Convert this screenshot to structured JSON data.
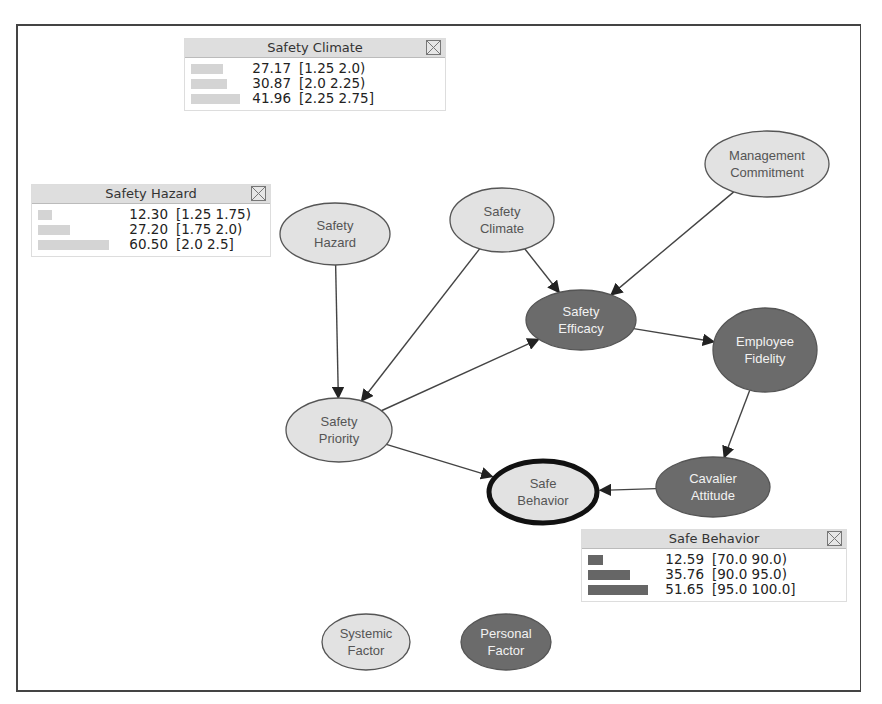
{
  "colors": {
    "light_node_fill": "#e2e2e2",
    "dark_node_fill": "#6b6b6b",
    "edge": "#444444",
    "light_bar": "#d4d4d4",
    "dark_bar": "#666666",
    "panel_header": "#dedede"
  },
  "nodes": [
    {
      "id": "safety-climate",
      "label": "Safety\nClimate",
      "type": "light",
      "cx": 502,
      "cy": 220,
      "rx": 52,
      "ry": 32
    },
    {
      "id": "management-commitment",
      "label": "Management\nCommitment",
      "type": "light",
      "cx": 767,
      "cy": 164,
      "rx": 62,
      "ry": 33
    },
    {
      "id": "safety-hazard",
      "label": "Safety\nHazard",
      "type": "light",
      "cx": 335,
      "cy": 234,
      "rx": 55,
      "ry": 31
    },
    {
      "id": "safety-efficacy",
      "label": "Safety\nEfficacy",
      "type": "dark",
      "cx": 581,
      "cy": 320,
      "rx": 55,
      "ry": 30
    },
    {
      "id": "employee-fidelity",
      "label": "Employee\nFidelity",
      "type": "dark",
      "cx": 765,
      "cy": 350,
      "rx": 52,
      "ry": 42
    },
    {
      "id": "safety-priority",
      "label": "Safety\nPriority",
      "type": "light",
      "cx": 339,
      "cy": 430,
      "rx": 53,
      "ry": 32
    },
    {
      "id": "cavalier-attitude",
      "label": "Cavalier\nAttitude",
      "type": "dark",
      "cx": 713,
      "cy": 487,
      "rx": 57,
      "ry": 30
    },
    {
      "id": "safe-behavior",
      "label": "Safe\nBehavior",
      "type": "selected",
      "cx": 543,
      "cy": 492,
      "rx": 54,
      "ry": 31
    },
    {
      "id": "systemic-factor",
      "label": "Systemic\nFactor",
      "type": "light",
      "cx": 366,
      "cy": 642,
      "rx": 44,
      "ry": 28
    },
    {
      "id": "personal-factor",
      "label": "Personal\nFactor",
      "type": "dark",
      "cx": 506,
      "cy": 642,
      "rx": 45,
      "ry": 28
    }
  ],
  "edges": [
    {
      "from": "safety-hazard",
      "to": "safety-priority"
    },
    {
      "from": "safety-climate",
      "to": "safety-priority"
    },
    {
      "from": "safety-climate",
      "to": "safety-efficacy"
    },
    {
      "from": "management-commitment",
      "to": "safety-efficacy"
    },
    {
      "from": "safety-priority",
      "to": "safety-efficacy"
    },
    {
      "from": "safety-efficacy",
      "to": "employee-fidelity"
    },
    {
      "from": "employee-fidelity",
      "to": "cavalier-attitude"
    },
    {
      "from": "safety-priority",
      "to": "safe-behavior"
    },
    {
      "from": "cavalier-attitude",
      "to": "safe-behavior"
    }
  ],
  "panels": [
    {
      "id": "safety-climate",
      "title": "Safety Climate",
      "x": 184,
      "y": 38,
      "w": 262,
      "bar_style": "light",
      "rows": [
        {
          "value": "27.17",
          "range": "[1.25 2.0)",
          "bar": 27.17
        },
        {
          "value": "30.87",
          "range": "[2.0 2.25)",
          "bar": 30.87
        },
        {
          "value": "41.96",
          "range": "[2.25 2.75]",
          "bar": 41.96
        }
      ]
    },
    {
      "id": "safety-hazard",
      "title": "Safety Hazard",
      "x": 31,
      "y": 184,
      "w": 240,
      "bar_style": "light",
      "rows": [
        {
          "value": "12.30",
          "range": "[1.25 1.75)",
          "bar": 12.3
        },
        {
          "value": "27.20",
          "range": "[1.75 2.0)",
          "bar": 27.2
        },
        {
          "value": "60.50",
          "range": "[2.0 2.5]",
          "bar": 60.5
        }
      ]
    },
    {
      "id": "safe-behavior",
      "title": "Safe Behavior",
      "x": 581,
      "y": 529,
      "w": 266,
      "bar_style": "dark",
      "rows": [
        {
          "value": "12.59",
          "range": "[70.0 90.0)",
          "bar": 12.59
        },
        {
          "value": "35.76",
          "range": "[90.0 95.0)",
          "bar": 35.76
        },
        {
          "value": "51.65",
          "range": "[95.0 100.0]",
          "bar": 51.65
        }
      ]
    }
  ],
  "labels": {
    "close_icon": "close-icon"
  }
}
